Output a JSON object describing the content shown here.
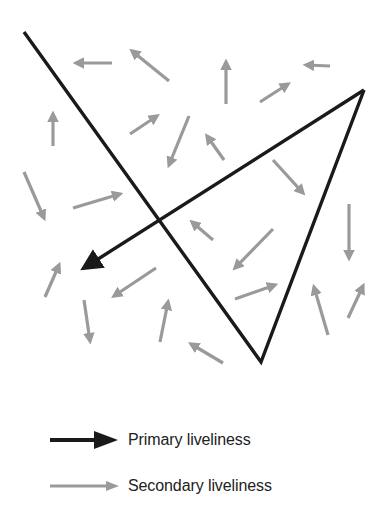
{
  "diagram": {
    "colors": {
      "primary": "#1a1a1a",
      "secondary": "#9a9a9a",
      "background": "#ffffff"
    },
    "primary_path": {
      "description": "Primary liveliness trajectory: long diagonal down to bottom vertex, up to right vertex, then arrow back to the left",
      "points": [
        [
          24,
          32
        ],
        [
          261,
          362
        ],
        [
          364,
          90
        ],
        [
          84,
          268
        ]
      ],
      "arrow_at_end": true
    },
    "secondary_arrows": [
      {
        "from": [
          112,
          63
        ],
        "to": [
          76,
          63
        ]
      },
      {
        "from": [
          169,
          81
        ],
        "to": [
          132,
          51
        ]
      },
      {
        "from": [
          226,
          104
        ],
        "to": [
          226,
          62
        ]
      },
      {
        "from": [
          260,
          102
        ],
        "to": [
          288,
          84
        ]
      },
      {
        "from": [
          330,
          66
        ],
        "to": [
          306,
          65
        ]
      },
      {
        "from": [
          53,
          146
        ],
        "to": [
          53,
          114
        ]
      },
      {
        "from": [
          130,
          134
        ],
        "to": [
          157,
          116
        ]
      },
      {
        "from": [
          189,
          116
        ],
        "to": [
          169,
          165
        ]
      },
      {
        "from": [
          224,
          160
        ],
        "to": [
          207,
          136
        ]
      },
      {
        "from": [
          273,
          160
        ],
        "to": [
          303,
          193
        ]
      },
      {
        "from": [
          24,
          172
        ],
        "to": [
          44,
          218
        ]
      },
      {
        "from": [
          73,
          208
        ],
        "to": [
          120,
          194
        ]
      },
      {
        "from": [
          213,
          240
        ],
        "to": [
          192,
          222
        ]
      },
      {
        "from": [
          273,
          229
        ],
        "to": [
          235,
          268
        ]
      },
      {
        "from": [
          349,
          204
        ],
        "to": [
          349,
          258
        ]
      },
      {
        "from": [
          45,
          297
        ],
        "to": [
          59,
          265
        ]
      },
      {
        "from": [
          156,
          268
        ],
        "to": [
          114,
          296
        ]
      },
      {
        "from": [
          84,
          300
        ],
        "to": [
          90,
          341
        ]
      },
      {
        "from": [
          160,
          342
        ],
        "to": [
          168,
          302
        ]
      },
      {
        "from": [
          235,
          299
        ],
        "to": [
          275,
          285
        ]
      },
      {
        "from": [
          328,
          335
        ],
        "to": [
          314,
          287
        ]
      },
      {
        "from": [
          348,
          318
        ],
        "to": [
          363,
          286
        ]
      },
      {
        "from": [
          223,
          363
        ],
        "to": [
          191,
          344
        ]
      }
    ]
  },
  "legend": {
    "items": [
      {
        "label": "Primary liveliness",
        "icon": "black-arrow-icon",
        "color": "#1a1a1a"
      },
      {
        "label": "Secondary liveliness",
        "icon": "gray-arrow-icon",
        "color": "#9a9a9a"
      }
    ]
  }
}
